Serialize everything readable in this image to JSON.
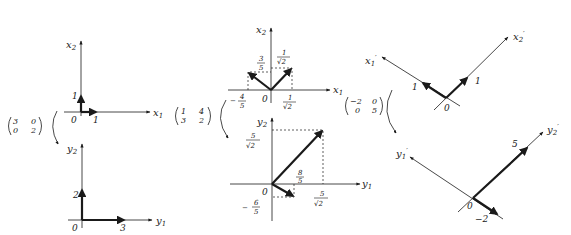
{
  "diagram": {
    "type": "linear-transformation-illustration",
    "colors": {
      "ink": "#1a1a1a",
      "background": "#ffffff"
    },
    "panels": [
      {
        "id": "diag-input",
        "axes": {
          "x": "x",
          "x_sub": "1",
          "y": "x",
          "y_sub": "2"
        },
        "origin_label": "0",
        "tick_labels": {
          "x": "1",
          "y": "1"
        },
        "vectors": [
          [
            1,
            0
          ],
          [
            0,
            1
          ]
        ]
      },
      {
        "id": "diag-output",
        "matrix": {
          "rows": [
            [
              "3",
              "0"
            ],
            [
              "0",
              "2"
            ]
          ]
        },
        "axes": {
          "x": "y",
          "x_sub": "1",
          "y": "y",
          "y_sub": "2"
        },
        "origin_label": "0",
        "tick_labels": {
          "x": "3",
          "y": "2"
        },
        "vectors": [
          [
            3,
            0
          ],
          [
            0,
            2
          ]
        ]
      },
      {
        "id": "general-input",
        "axes": {
          "x": "x",
          "x_sub": "1",
          "y": "x",
          "y_sub": "2"
        },
        "origin_label": "0",
        "tick_labels": {
          "left_x_sign": "−",
          "left_x_num": "4",
          "left_x_den": "5",
          "left_y_num": "3",
          "left_y_den": "5",
          "right_x_num": "1",
          "right_x_den": "√2",
          "right_y_num": "1",
          "right_y_den": "√2"
        },
        "vectors": [
          [
            "-4/5",
            "3/5"
          ],
          [
            "1/√2",
            "1/√2"
          ]
        ]
      },
      {
        "id": "general-output",
        "matrix": {
          "rows": [
            [
              "1",
              "4"
            ],
            [
              "3",
              "2"
            ]
          ]
        },
        "axes": {
          "x": "y",
          "x_sub": "1",
          "y": "y",
          "y_sub": "2"
        },
        "origin_label": "0",
        "tick_labels": {
          "big_y_num": "5",
          "big_y_den": "√2",
          "big_x_num": "5",
          "big_x_den": "√2",
          "small_x_num": "8",
          "small_x_den": "5",
          "small_y_sign": "−",
          "small_y_num": "6",
          "small_y_den": "5"
        },
        "vectors": [
          [
            "8/5",
            "-6/5"
          ],
          [
            "5/√2",
            "5/√2"
          ]
        ]
      },
      {
        "id": "eigen-input",
        "axes": {
          "a": "x",
          "a_sub": "1",
          "a_prime": "′",
          "b": "x",
          "b_sub": "2",
          "b_prime": "′"
        },
        "origin_label": "0",
        "tick_labels": {
          "a": "1",
          "b": "1"
        }
      },
      {
        "id": "eigen-output",
        "matrix": {
          "rows": [
            [
              "−2",
              "0"
            ],
            [
              "0",
              "5"
            ]
          ]
        },
        "axes": {
          "a": "y",
          "a_sub": "1",
          "a_prime": "′",
          "b": "y",
          "b_sub": "2",
          "b_prime": "′"
        },
        "origin_label": "0",
        "tick_labels": {
          "a": "−2",
          "b": "5"
        }
      }
    ]
  }
}
